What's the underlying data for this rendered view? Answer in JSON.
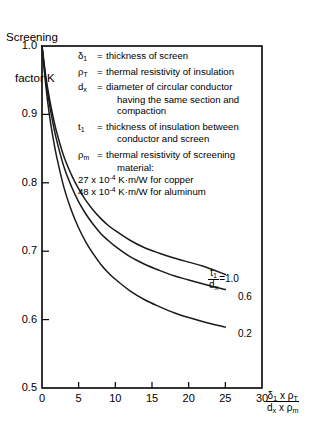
{
  "chart_data": {
    "type": "line",
    "title": "",
    "ylabel_line1": "Screening",
    "ylabel_line2": "factor K",
    "xlabel_numerator": "δ₁ × ρ_T",
    "xlabel_denominator": "dₓ × ρ_m",
    "xlim": [
      0,
      30
    ],
    "ylim": [
      0.5,
      1.0
    ],
    "xticks": [
      "0",
      "5",
      "10",
      "15",
      "20",
      "25",
      "30"
    ],
    "xtick_values": [
      0,
      5,
      10,
      15,
      20,
      25,
      30
    ],
    "yticks": [
      "0.5",
      "0.6",
      "0.7",
      "0.8",
      "0.9",
      "1.0"
    ],
    "ytick_values": [
      0.5,
      0.6,
      0.7,
      0.8,
      0.9,
      1.0
    ],
    "grid": false,
    "legend_position": "inline-right-of-curves",
    "series": [
      {
        "name": "t1/dx = 1.0",
        "label": "1.0",
        "x": [
          0,
          0.5,
          1,
          1.5,
          2,
          3,
          4,
          5,
          6,
          7,
          8,
          9,
          10,
          12,
          14,
          16,
          18,
          20,
          22,
          25
        ],
        "y": [
          1.0,
          0.957,
          0.924,
          0.897,
          0.874,
          0.838,
          0.812,
          0.791,
          0.774,
          0.76,
          0.748,
          0.738,
          0.73,
          0.716,
          0.705,
          0.697,
          0.69,
          0.684,
          0.678,
          0.666
        ]
      },
      {
        "name": "t1/dx = 0.6",
        "label": "0.6",
        "x": [
          0,
          0.5,
          1,
          1.5,
          2,
          3,
          4,
          5,
          6,
          7,
          8,
          9,
          10,
          12,
          14,
          16,
          18,
          20,
          22,
          25
        ],
        "y": [
          1.0,
          0.952,
          0.916,
          0.887,
          0.862,
          0.823,
          0.795,
          0.772,
          0.754,
          0.739,
          0.726,
          0.716,
          0.707,
          0.692,
          0.681,
          0.672,
          0.664,
          0.658,
          0.652,
          0.644
        ]
      },
      {
        "name": "t1/dx = 0.2",
        "label": "0.2",
        "x": [
          0,
          0.5,
          1,
          1.5,
          2,
          3,
          4,
          5,
          6,
          7,
          8,
          9,
          10,
          12,
          14,
          16,
          18,
          20,
          22,
          25
        ],
        "y": [
          1.0,
          0.944,
          0.9,
          0.866,
          0.838,
          0.793,
          0.76,
          0.734,
          0.713,
          0.696,
          0.681,
          0.669,
          0.659,
          0.642,
          0.629,
          0.619,
          0.61,
          0.603,
          0.597,
          0.589
        ]
      }
    ],
    "curve_label_fraction_numerator": "t₁",
    "curve_label_fraction_denominator": "dₓ",
    "curve_label_equals": "=1.0"
  },
  "notes": {
    "rows": [
      {
        "symbol": "δ₁",
        "equals": "=",
        "text": "thickness of screen",
        "continuation": []
      },
      {
        "symbol": "ρ_T",
        "equals": "=",
        "text": "thermal resistivity of insulation",
        "continuation": []
      },
      {
        "symbol": "d_x",
        "equals": "=",
        "text": "diameter of circular conductor",
        "continuation": [
          "having the same section and",
          "compaction"
        ]
      },
      {
        "symbol": "t₁",
        "equals": "=",
        "text": "thickness of insulation between",
        "continuation": [
          "conductor and screen"
        ]
      },
      {
        "symbol": "ρ_m",
        "equals": "=",
        "text": "thermal resistivity of screening",
        "continuation": [
          "material:"
        ]
      }
    ],
    "material_lines": [
      "27 x 10⁻⁴ K·m/W for copper",
      "48 x 10⁻⁴ K·m/W for aluminum"
    ],
    "material_copper_coeff": "27",
    "material_copper_exp": "-4",
    "material_copper_unit": "K·m/W for copper",
    "material_alu_coeff": "48",
    "material_alu_exp": "-4",
    "material_alu_unit": "K·m/W for aluminum"
  },
  "colors": {
    "axis": "#000000",
    "curve": "#1a1a1a",
    "background": "#ffffff"
  }
}
